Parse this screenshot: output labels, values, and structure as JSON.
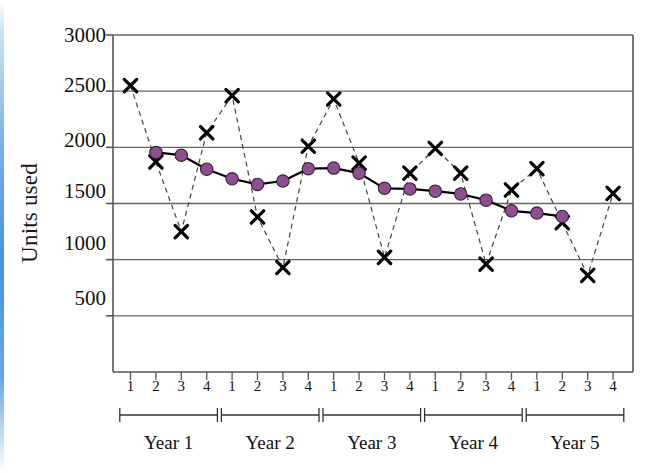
{
  "axis": {
    "ylabel": "Units used",
    "yticks": [
      3000,
      2500,
      2000,
      1500,
      1000,
      500
    ],
    "quarter_labels": [
      "1",
      "2",
      "3",
      "4",
      "1",
      "2",
      "3",
      "4",
      "1",
      "2",
      "3",
      "4",
      "1",
      "2",
      "3",
      "4",
      "1",
      "2",
      "3",
      "4"
    ],
    "year_labels": [
      "Year 1",
      "Year 2",
      "Year 3",
      "Year 4",
      "Year 5"
    ]
  },
  "colors": {
    "marker_raw": "#000000",
    "marker_smoothed": "#8e4f8e",
    "marker_smoothed_stroke": "#3c1f3c",
    "line_raw": "#444444",
    "line_smoothed": "#000000",
    "grid": "#666666",
    "frame": "#555555",
    "edge_strip": "#4a90d9"
  },
  "top_fragment": "",
  "chart_data": {
    "type": "line",
    "title": "",
    "xlabel": "",
    "ylabel": "Units used",
    "ylim": [
      0,
      3000
    ],
    "ytick_step": 500,
    "grid": true,
    "legend": "none",
    "x": [
      "Y1Q1",
      "Y1Q2",
      "Y1Q3",
      "Y1Q4",
      "Y2Q1",
      "Y2Q2",
      "Y2Q3",
      "Y2Q4",
      "Y3Q1",
      "Y3Q2",
      "Y3Q3",
      "Y3Q4",
      "Y4Q1",
      "Y4Q2",
      "Y4Q3",
      "Y4Q4",
      "Y5Q1",
      "Y5Q2",
      "Y5Q3",
      "Y5Q4"
    ],
    "categories": [
      "1",
      "2",
      "3",
      "4",
      "1",
      "2",
      "3",
      "4",
      "1",
      "2",
      "3",
      "4",
      "1",
      "2",
      "3",
      "4",
      "1",
      "2",
      "3",
      "4"
    ],
    "groups": [
      {
        "label": "Year 1",
        "quarters": [
          "1",
          "2",
          "3",
          "4"
        ]
      },
      {
        "label": "Year 2",
        "quarters": [
          "1",
          "2",
          "3",
          "4"
        ]
      },
      {
        "label": "Year 3",
        "quarters": [
          "1",
          "2",
          "3",
          "4"
        ]
      },
      {
        "label": "Year 4",
        "quarters": [
          "1",
          "2",
          "3",
          "4"
        ]
      },
      {
        "label": "Year 5",
        "quarters": [
          "1",
          "2",
          "3",
          "4"
        ]
      }
    ],
    "series": [
      {
        "name": "Units used (raw quarterly)",
        "marker": "x",
        "linestyle": "dashed",
        "color": "#000000",
        "values": [
          2550,
          1870,
          1250,
          2130,
          2460,
          1380,
          930,
          2010,
          2430,
          1860,
          1020,
          1770,
          1990,
          1770,
          960,
          1620,
          1810,
          1330,
          860,
          1590
        ]
      },
      {
        "name": "Moving average (smoothed)",
        "marker": "circle",
        "linestyle": "solid",
        "color": "#8e4f8e",
        "x_offset": 1,
        "values": [
          null,
          1955,
          1930,
          1805,
          1720,
          1670,
          1700,
          1810,
          1815,
          1770,
          1635,
          1630,
          1610,
          1585,
          1530,
          1435,
          1415,
          1385,
          null,
          null
        ]
      }
    ]
  }
}
